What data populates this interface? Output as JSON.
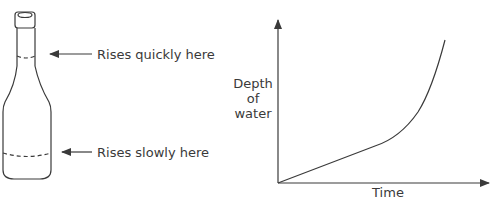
{
  "bottle": {
    "annotations": [
      {
        "id": "neck",
        "text": "Rises quickly here"
      },
      {
        "id": "body",
        "text": "Rises slowly here"
      }
    ]
  },
  "graph": {
    "y_label_lines": [
      "Depth",
      "of",
      "water"
    ],
    "x_label": "Time",
    "curve_description": "Depth rises slowly and linearly at first, then curves sharply upward"
  },
  "colors": {
    "ink": "#3a3a3a",
    "background": "#ffffff"
  }
}
